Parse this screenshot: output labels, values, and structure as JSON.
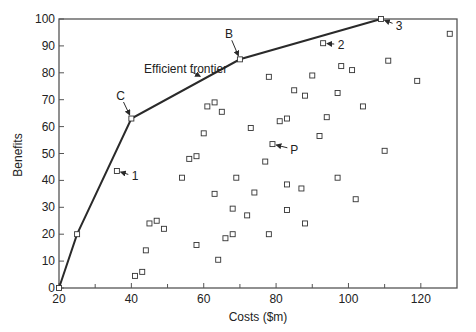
{
  "chart_data": {
    "type": "scatter",
    "title": "",
    "xlabel": "Costs ($m)",
    "ylabel": "Benefits",
    "xlim": [
      20,
      130
    ],
    "ylim": [
      0,
      100
    ],
    "xticks": [
      20,
      40,
      60,
      80,
      100,
      120
    ],
    "xminor": [
      30,
      50,
      70,
      90,
      110
    ],
    "yticks": [
      0,
      10,
      20,
      30,
      40,
      50,
      60,
      70,
      80,
      90,
      100
    ],
    "grid": false,
    "legend": null,
    "series": [
      {
        "name": "Efficient frontier",
        "kind": "line",
        "points": [
          [
            20,
            0
          ],
          [
            25,
            20
          ],
          [
            40,
            63
          ],
          [
            70,
            85
          ],
          [
            109,
            100
          ]
        ]
      },
      {
        "name": "Projects",
        "kind": "scatter",
        "marker": "open-square",
        "points": [
          [
            20,
            0
          ],
          [
            25,
            20
          ],
          [
            40,
            63
          ],
          [
            70,
            85
          ],
          [
            109,
            100
          ],
          [
            36,
            43.5
          ],
          [
            41,
            4.5
          ],
          [
            43,
            6
          ],
          [
            44,
            14
          ],
          [
            45,
            24
          ],
          [
            47,
            25
          ],
          [
            49,
            22
          ],
          [
            54,
            41
          ],
          [
            56,
            48
          ],
          [
            58,
            16
          ],
          [
            58,
            49
          ],
          [
            60,
            57.5
          ],
          [
            61,
            67.5
          ],
          [
            63,
            69
          ],
          [
            63,
            35
          ],
          [
            64,
            10.5
          ],
          [
            65,
            65.5
          ],
          [
            66,
            18.5
          ],
          [
            68,
            20
          ],
          [
            68,
            29.5
          ],
          [
            69,
            41
          ],
          [
            72,
            27
          ],
          [
            73,
            59.5
          ],
          [
            74,
            35.5
          ],
          [
            77,
            47
          ],
          [
            78,
            78.5
          ],
          [
            78,
            20
          ],
          [
            79,
            53.5
          ],
          [
            81,
            62
          ],
          [
            83,
            63
          ],
          [
            83,
            29
          ],
          [
            83,
            38.5
          ],
          [
            85,
            73.5
          ],
          [
            87,
            37
          ],
          [
            88,
            24
          ],
          [
            88,
            71.5
          ],
          [
            90,
            79
          ],
          [
            92,
            56.5
          ],
          [
            93,
            91
          ],
          [
            94,
            63.5
          ],
          [
            97,
            41
          ],
          [
            97,
            72.5
          ],
          [
            98,
            82.5
          ],
          [
            101,
            81
          ],
          [
            102,
            33
          ],
          [
            104,
            67.5
          ],
          [
            110,
            51
          ],
          [
            111,
            84.5
          ],
          [
            119,
            77
          ],
          [
            128,
            94.5
          ]
        ]
      }
    ],
    "annotations": [
      {
        "label": "Efficient frontier",
        "x": 55,
        "y": 80,
        "arrow_to": [
          60,
          78
        ]
      },
      {
        "label": "C",
        "x": 37,
        "y": 70,
        "arrow_to": [
          40,
          63
        ]
      },
      {
        "label": "B",
        "x": 67,
        "y": 93,
        "arrow_to": [
          70,
          85
        ]
      },
      {
        "label": "3",
        "x": 114,
        "y": 96,
        "arrow_to": [
          109,
          100
        ]
      },
      {
        "label": "2",
        "x": 98,
        "y": 89,
        "arrow_to": [
          93,
          91
        ]
      },
      {
        "label": "1",
        "x": 41,
        "y": 40,
        "arrow_to": [
          36,
          43.5
        ]
      },
      {
        "label": "P",
        "x": 85,
        "y": 50,
        "arrow_to": [
          79,
          53.5
        ]
      }
    ]
  },
  "axes": {
    "x_title": "Costs ($m)",
    "y_title": "Benefits"
  },
  "colors": {
    "line": "#2a2a2a",
    "marker": "#333333",
    "axis": "#555555",
    "text": "#222222"
  }
}
